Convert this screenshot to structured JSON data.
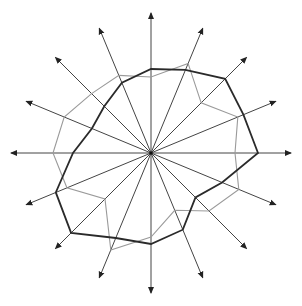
{
  "diagram": {
    "type": "radar-star",
    "center": [
      151,
      153
    ],
    "axis_count": 16,
    "axis_angles_deg": [
      0,
      22.5,
      45,
      67.5,
      90,
      112.5,
      135,
      157.5,
      180,
      202.5,
      225,
      247.5,
      270,
      292.5,
      315,
      337.5
    ],
    "axis_length": [
      140,
      135,
      135,
      135,
      140,
      135,
      135,
      135,
      140,
      135,
      135,
      135,
      140,
      135,
      135,
      135
    ],
    "colors": {
      "axis": "#444444",
      "series_dark": "#2a2a2a",
      "series_light": "#9a9a9a",
      "background": "#ffffff"
    },
    "series": [
      {
        "name": "light-polygon",
        "radii": [
          84,
          94,
          71,
          97,
          76,
          84,
          84,
          94,
          98,
          91,
          65,
          105,
          84,
          62,
          82,
          95
        ]
      },
      {
        "name": "dark-polygon",
        "radii": [
          107,
          100,
          105,
          90,
          84,
          76,
          66,
          64,
          78,
          103,
          113,
          92,
          91,
          83,
          63,
          77
        ]
      }
    ]
  }
}
